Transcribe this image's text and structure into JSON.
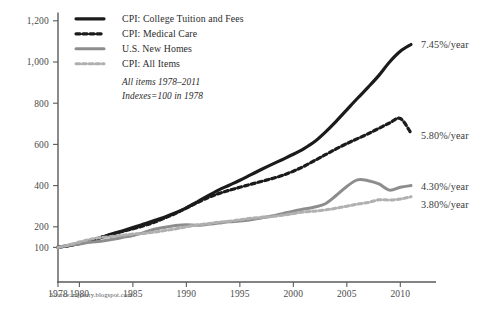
{
  "chart_data": {
    "type": "line",
    "title": "",
    "subtitle": "",
    "xlabel": "",
    "ylabel": "",
    "xlim": [
      1978,
      2011
    ],
    "ylim": [
      0,
      1240
    ],
    "grid": false,
    "legend_position": "top-left",
    "y_ticks": [
      100,
      200,
      400,
      600,
      800,
      1000,
      1200
    ],
    "y_tick_labels": [
      "100",
      "200",
      "400",
      "600",
      "800",
      "1,000",
      "1,200"
    ],
    "x_ticks": [
      1978,
      1980,
      1985,
      1990,
      1995,
      2000,
      2005,
      2010
    ],
    "x_tick_labels": [
      "1978",
      "1980",
      "1985",
      "1990",
      "1995",
      "2000",
      "2005",
      "2010"
    ],
    "x": [
      1978,
      1979,
      1980,
      1981,
      1982,
      1983,
      1984,
      1985,
      1986,
      1987,
      1988,
      1989,
      1990,
      1991,
      1992,
      1993,
      1994,
      1995,
      1996,
      1997,
      1998,
      1999,
      2000,
      2001,
      2002,
      2003,
      2004,
      2005,
      2006,
      2007,
      2008,
      2009,
      2010,
      2011
    ],
    "series": [
      {
        "name": "CPI: College Tuition and Fees",
        "color": "#1b1b1b",
        "style": "solid",
        "width": 3.2,
        "annotation": "7.45%/year",
        "values": [
          100,
          109,
          119,
          132,
          148,
          165,
          180,
          196,
          213,
          230,
          248,
          268,
          292,
          320,
          350,
          378,
          402,
          426,
          452,
          478,
          503,
          527,
          552,
          580,
          614,
          660,
          712,
          768,
          824,
          878,
          935,
          1000,
          1052,
          1085
        ]
      },
      {
        "name": "CPI: Medical Care",
        "color": "#1b1b1b",
        "style": "dashed",
        "width": 3.2,
        "annotation": "5.80%/year",
        "values": [
          100,
          109,
          119,
          132,
          148,
          163,
          177,
          190,
          205,
          222,
          243,
          265,
          291,
          317,
          341,
          361,
          377,
          392,
          406,
          420,
          434,
          450,
          470,
          494,
          522,
          550,
          578,
          604,
          628,
          652,
          678,
          704,
          726,
          655
        ]
      },
      {
        "name": "U.S. New Homes",
        "color": "#8d8d8d",
        "style": "solid",
        "width": 3.0,
        "annotation": "4.30%/year",
        "values": [
          100,
          110,
          117,
          125,
          130,
          138,
          148,
          158,
          172,
          188,
          198,
          206,
          210,
          207,
          212,
          218,
          224,
          228,
          234,
          243,
          252,
          264,
          276,
          286,
          296,
          312,
          352,
          396,
          428,
          424,
          408,
          378,
          392,
          400
        ]
      },
      {
        "name": "CPI: All Items",
        "color": "#b0b0b0",
        "style": "dashed",
        "width": 3.0,
        "annotation": "3.80%/year",
        "values": [
          100,
          111,
          126,
          139,
          148,
          153,
          159,
          165,
          168,
          174,
          182,
          190,
          200,
          209,
          215,
          222,
          227,
          234,
          241,
          246,
          250,
          256,
          264,
          272,
          276,
          282,
          290,
          300,
          310,
          318,
          331,
          330,
          335,
          346
        ]
      }
    ],
    "notes": [
      "All items 1978–2011",
      "Indexes=100 in 1978"
    ],
    "source": "Source: mjperry.blogspot.com"
  },
  "axis": {
    "color": "#5a5a5a"
  }
}
